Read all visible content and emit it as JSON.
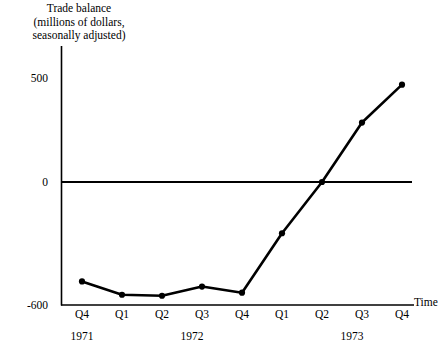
{
  "chart_data": {
    "type": "line",
    "title": "",
    "ylabel": "Trade balance\n(millions of dollars,\nseasonally adjusted)",
    "xlabel": "Time",
    "categories": [
      "Q4",
      "Q1",
      "Q2",
      "Q3",
      "Q4",
      "Q1",
      "Q2",
      "Q3",
      "Q4"
    ],
    "period_groups": [
      {
        "year": "1971",
        "quarters": [
          "Q4"
        ]
      },
      {
        "year": "1972",
        "quarters": [
          "Q1",
          "Q2",
          "Q3",
          "Q4"
        ]
      },
      {
        "year": "1973",
        "quarters": [
          "Q1",
          "Q2",
          "Q3",
          "Q4"
        ]
      }
    ],
    "values": [
      -485,
      -550,
      -555,
      -510,
      -540,
      -250,
      0,
      290,
      475
    ],
    "ylim": [
      -600,
      600
    ],
    "yticks": [
      500,
      0,
      -600
    ],
    "ytick_labels": [
      "500",
      "0",
      "-600"
    ],
    "grid": false,
    "legend": null,
    "series_color": "#000000",
    "marker": "circle",
    "zero_reference_line": 0
  },
  "axis": {
    "y_title": "Trade balance\n(millions of dollars,\nseasonally adjusted)",
    "x_title": "Time",
    "y_ticks": [
      "500",
      "0",
      "-600"
    ],
    "x_ticks": [
      "Q4",
      "Q1",
      "Q2",
      "Q3",
      "Q4",
      "Q1",
      "Q2",
      "Q3",
      "Q4"
    ],
    "years": [
      "1971",
      "1972",
      "1973"
    ]
  }
}
